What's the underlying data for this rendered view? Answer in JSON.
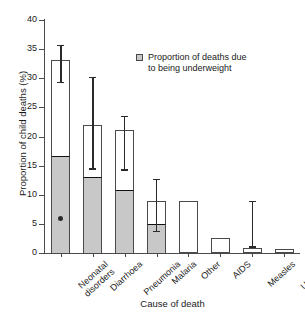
{
  "chart_data": {
    "type": "bar",
    "title": "",
    "subtitle": "",
    "xlabel": "Cause of death",
    "ylabel": "Proportion of child deaths (%)",
    "ylim": [
      0,
      40
    ],
    "yticks": [
      0,
      5,
      10,
      15,
      20,
      25,
      30,
      35,
      40
    ],
    "grid": false,
    "legend_position": "upper-center",
    "legend": [
      "Proportion of deaths due\nto being underweight"
    ],
    "categories": [
      "Neonatal\ndisorders",
      "Diarrhoea",
      "Pneumonia",
      "Malaria",
      "Other",
      "AIDS",
      "Measles",
      "Unknown"
    ],
    "series": [
      {
        "name": "Total proportion of child deaths",
        "values": [
          33.2,
          21.9,
          21.1,
          8.9,
          8.9,
          2.6,
          0.9,
          0.7
        ]
      },
      {
        "name": "Proportion of deaths due to being underweight",
        "values": [
          16.7,
          13.1,
          10.8,
          4.9,
          null,
          null,
          null,
          null
        ]
      }
    ],
    "error_bars": [
      {
        "category": "Neonatal disorders",
        "low": 29.2,
        "high": 35.5
      },
      {
        "category": "Diarrhoea",
        "low": 14.3,
        "high": 30.0
      },
      {
        "category": "Pneumonia",
        "low": 14.1,
        "high": 23.3
      },
      {
        "category": "Malaria",
        "low": 3.6,
        "high": 12.5
      },
      {
        "category": "Other",
        "low": null,
        "high": null
      },
      {
        "category": "AIDS",
        "low": null,
        "high": null
      },
      {
        "category": "Measles",
        "low": 0.9,
        "high": 8.7
      },
      {
        "category": "Unknown",
        "low": null,
        "high": null
      }
    ],
    "point_markers": [
      {
        "category": "Neonatal disorders",
        "value": 6.0
      }
    ],
    "colors": {
      "underweight_fill": "#c8c8c8",
      "total_fill": "#ffffff",
      "outline": "#4a4a4a",
      "error_bar": "#2a2a2a",
      "marker": "#2b2b2b"
    }
  },
  "axis": {
    "y_tick_labels": [
      "0",
      "5",
      "10",
      "15",
      "20",
      "25",
      "30",
      "35",
      "40"
    ],
    "y_title": "Proportion of child deaths (%)",
    "x_title": "Cause of death"
  },
  "legend": {
    "label": "Proportion of deaths due\nto being underweight",
    "swatch": "legend-square-gray"
  }
}
